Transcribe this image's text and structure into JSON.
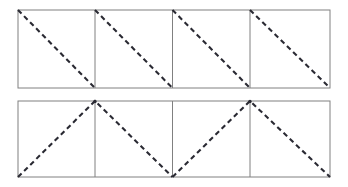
{
  "figure": {
    "kind": "geometric-line-diagram",
    "canvas": {
      "width": 348,
      "height": 187,
      "background": "#ffffff"
    },
    "style": {
      "frame_color": "#808080",
      "divider_color": "#808080",
      "frame_stroke_width": 1,
      "divider_stroke_width": 1,
      "dash_color": "#2a2a33",
      "dash_stroke_width": 2.1,
      "dash_pattern": "5,3.6"
    },
    "rows": [
      {
        "name": "top-row",
        "label": "Top band: four cells each with a falling diagonal",
        "frame": {
          "x": 18,
          "y": 10,
          "width": 312,
          "height": 78
        },
        "dividers_x": [
          95,
          172.5,
          250
        ],
        "cell_count": 4,
        "pattern": "sawtooth-falling-diagonals",
        "polylines": [
          {
            "name": "diagonal-cell-1",
            "points": "18,10 95,88"
          },
          {
            "name": "diagonal-cell-2",
            "points": "95,10 172.5,88"
          },
          {
            "name": "diagonal-cell-3",
            "points": "172.5,10 250,88"
          },
          {
            "name": "diagonal-cell-4",
            "points": "250,10 330,88"
          }
        ]
      },
      {
        "name": "bottom-row",
        "label": "Bottom band: four cells forming two dashed triangles",
        "frame": {
          "x": 18,
          "y": 101,
          "width": 312,
          "height": 76
        },
        "dividers_x": [
          95,
          172.5,
          250
        ],
        "cell_count": 4,
        "pattern": "triangular-zigzag",
        "polylines": [
          {
            "name": "zigzag-triangle-1",
            "points": "18,177 95,101 172.5,177"
          },
          {
            "name": "zigzag-triangle-2",
            "points": "172.5,177 250,101 330,177"
          }
        ]
      }
    ],
    "apex_markers": [
      {
        "name": "apex-left",
        "x": 95,
        "y": 101
      },
      {
        "name": "apex-right",
        "x": 250,
        "y": 101
      }
    ]
  }
}
